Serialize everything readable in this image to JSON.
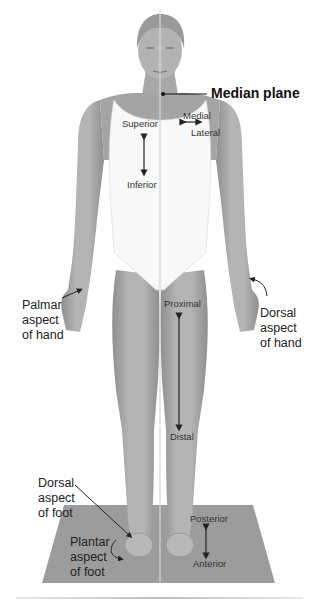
{
  "diagram": {
    "title_label": "Median plane",
    "labels": {
      "superior": "Superior",
      "inferior": "Inferior",
      "medial": "Medial",
      "lateral": "Lateral",
      "proximal": "Proximal",
      "distal": "Distal",
      "posterior": "Posterior",
      "anterior": "Anterior",
      "palmar_hand": "Palmar\naspect\nof hand",
      "dorsal_hand": "Dorsal\naspect\nof hand",
      "dorsal_foot": "Dorsal\naspect\nof foot",
      "plantar_foot": "Plantar\naspect\nof foot"
    },
    "colors": {
      "skin": "#a9a9a9",
      "skin_dark": "#8e8e8e",
      "suit": "#f7f7f7",
      "floor": "#9a9a9a",
      "line": "#222222",
      "median_line": "#cfcfcf"
    }
  }
}
